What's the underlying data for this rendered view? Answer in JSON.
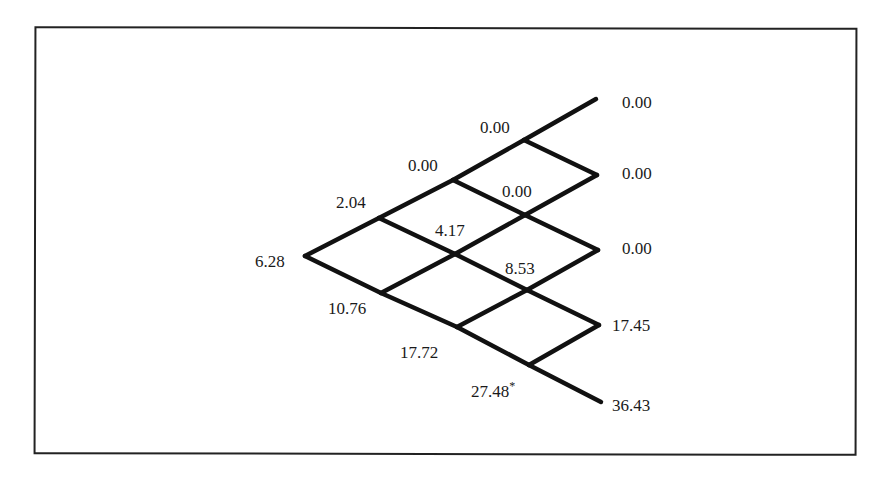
{
  "diagram": {
    "type": "binomial-tree",
    "steps": 4,
    "line_color": "#111111",
    "nodes": [
      {
        "id": "n0_0",
        "level": 0,
        "index": 0,
        "value": "6.28",
        "x": 305,
        "y": 256,
        "lx": 255,
        "ly": 253,
        "marker": ""
      },
      {
        "id": "n1_0",
        "level": 1,
        "index": 0,
        "value": "2.04",
        "x": 379,
        "y": 218,
        "lx": 336,
        "ly": 194,
        "marker": ""
      },
      {
        "id": "n1_1",
        "level": 1,
        "index": 1,
        "value": "10.76",
        "x": 381,
        "y": 293,
        "lx": 328,
        "ly": 300,
        "marker": ""
      },
      {
        "id": "n2_0",
        "level": 2,
        "index": 0,
        "value": "0.00",
        "x": 453,
        "y": 180,
        "lx": 408,
        "ly": 157,
        "marker": ""
      },
      {
        "id": "n2_1",
        "level": 2,
        "index": 1,
        "value": "4.17",
        "x": 455,
        "y": 254,
        "lx": 435,
        "ly": 222,
        "marker": ""
      },
      {
        "id": "n2_2",
        "level": 2,
        "index": 2,
        "value": "17.72",
        "x": 457,
        "y": 327,
        "lx": 400,
        "ly": 344,
        "marker": ""
      },
      {
        "id": "n3_0",
        "level": 3,
        "index": 0,
        "value": "0.00",
        "x": 524,
        "y": 140,
        "lx": 480,
        "ly": 119,
        "marker": ""
      },
      {
        "id": "n3_1",
        "level": 3,
        "index": 1,
        "value": "0.00",
        "x": 525,
        "y": 215,
        "lx": 502,
        "ly": 183,
        "marker": ""
      },
      {
        "id": "n3_2",
        "level": 3,
        "index": 2,
        "value": "8.53",
        "x": 527,
        "y": 290,
        "lx": 505,
        "ly": 260,
        "marker": ""
      },
      {
        "id": "n3_3",
        "level": 3,
        "index": 3,
        "value": "27.48",
        "x": 529,
        "y": 365,
        "lx": 471,
        "ly": 377,
        "marker": "*"
      },
      {
        "id": "n4_0",
        "level": 4,
        "index": 0,
        "value": "0.00",
        "x": 596,
        "y": 99,
        "lx": 622,
        "ly": 94,
        "marker": ""
      },
      {
        "id": "n4_1",
        "level": 4,
        "index": 1,
        "value": "0.00",
        "x": 597,
        "y": 175,
        "lx": 622,
        "ly": 165,
        "marker": ""
      },
      {
        "id": "n4_2",
        "level": 4,
        "index": 2,
        "value": "0.00",
        "x": 598,
        "y": 250,
        "lx": 622,
        "ly": 240,
        "marker": ""
      },
      {
        "id": "n4_3",
        "level": 4,
        "index": 3,
        "value": "17.45",
        "x": 599,
        "y": 325,
        "lx": 612,
        "ly": 317,
        "marker": ""
      },
      {
        "id": "n4_4",
        "level": 4,
        "index": 4,
        "value": "36.43",
        "x": 601,
        "y": 402,
        "lx": 612,
        "ly": 397,
        "marker": ""
      }
    ],
    "edges": [
      [
        "n0_0",
        "n1_0"
      ],
      [
        "n0_0",
        "n1_1"
      ],
      [
        "n1_0",
        "n2_0"
      ],
      [
        "n1_0",
        "n2_1"
      ],
      [
        "n1_1",
        "n2_1"
      ],
      [
        "n1_1",
        "n2_2"
      ],
      [
        "n2_0",
        "n3_0"
      ],
      [
        "n2_0",
        "n3_1"
      ],
      [
        "n2_1",
        "n3_1"
      ],
      [
        "n2_1",
        "n3_2"
      ],
      [
        "n2_2",
        "n3_2"
      ],
      [
        "n2_2",
        "n3_3"
      ],
      [
        "n3_0",
        "n4_0"
      ],
      [
        "n3_0",
        "n4_1"
      ],
      [
        "n3_1",
        "n4_1"
      ],
      [
        "n3_1",
        "n4_2"
      ],
      [
        "n3_2",
        "n4_2"
      ],
      [
        "n3_2",
        "n4_3"
      ],
      [
        "n3_3",
        "n4_3"
      ],
      [
        "n3_3",
        "n4_4"
      ]
    ]
  }
}
